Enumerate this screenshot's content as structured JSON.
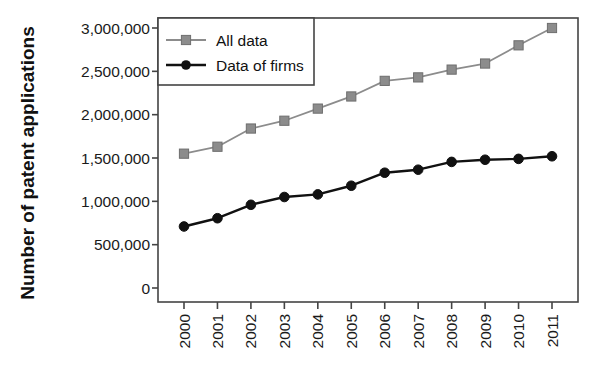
{
  "chart_data": {
    "type": "line",
    "title": "",
    "xlabel": "",
    "ylabel": "Number of patent applications",
    "categories": [
      "2000",
      "2001",
      "2002",
      "2003",
      "2004",
      "2005",
      "2006",
      "2007",
      "2008",
      "2009",
      "2010",
      "2011"
    ],
    "x": [
      2000,
      2001,
      2002,
      2003,
      2004,
      2005,
      2006,
      2007,
      2008,
      2009,
      2010,
      2011
    ],
    "series": [
      {
        "name": "All data",
        "color": "#8c8c8c",
        "marker": "square",
        "values": [
          1550000,
          1630000,
          1840000,
          1930000,
          2070000,
          2210000,
          2390000,
          2430000,
          2520000,
          2590000,
          2800000,
          3000000
        ]
      },
      {
        "name": "Data of firms",
        "color": "#111111",
        "marker": "circle",
        "values": [
          710000,
          805000,
          960000,
          1050000,
          1080000,
          1180000,
          1330000,
          1365000,
          1455000,
          1480000,
          1490000,
          1520000
        ]
      }
    ],
    "ylim": [
      0,
      3000000
    ],
    "yticks": [
      0,
      500000,
      1000000,
      1500000,
      2000000,
      2500000,
      3000000
    ],
    "ytick_labels": [
      "0",
      "500,000",
      "1,000,000",
      "1,500,000",
      "2,000,000",
      "2,500,000",
      "3,000,000"
    ],
    "xtick_labels": [
      "2000",
      "2001",
      "2002",
      "2003",
      "2004",
      "2005",
      "2006",
      "2007",
      "2008",
      "2009",
      "2010",
      "2011"
    ],
    "xtick_rotation": 90,
    "grid": false,
    "legend_position": "top-left",
    "legend_entries": [
      {
        "label": "All data",
        "color": "#8c8c8c",
        "marker": "square"
      },
      {
        "label": "Data of firms",
        "color": "#111111",
        "marker": "circle"
      }
    ]
  },
  "axis": {
    "y_title": "Number of patent applications"
  }
}
